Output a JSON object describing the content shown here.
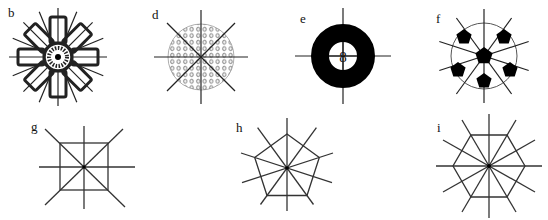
{
  "figure": {
    "panels": [
      {
        "id": "b",
        "label": "b",
        "shape": "rosette-octagonal",
        "rays": 16,
        "center": [
          58,
          57
        ]
      },
      {
        "id": "d",
        "label": "d",
        "shape": "dotted-circle",
        "rays": 8,
        "center": [
          201,
          57
        ]
      },
      {
        "id": "e",
        "label": "e",
        "shape": "annulus",
        "rays": 4,
        "center": [
          343,
          56
        ],
        "center_glyph": "8"
      },
      {
        "id": "f",
        "label": "f",
        "shape": "circle-with-pentagons",
        "rays": 10,
        "center": [
          484,
          56
        ]
      },
      {
        "id": "g",
        "label": "g",
        "shape": "square",
        "rays": 8,
        "center": [
          84,
          167
        ]
      },
      {
        "id": "h",
        "label": "h",
        "shape": "pentagon",
        "rays": 10,
        "center": [
          287,
          168
        ]
      },
      {
        "id": "i",
        "label": "i",
        "shape": "hexagon",
        "rays": 12,
        "center": [
          489,
          166
        ]
      }
    ],
    "colors": {
      "ink": "#222222",
      "fill": "#000000",
      "background": "#ffffff",
      "thin": "#555555"
    }
  }
}
